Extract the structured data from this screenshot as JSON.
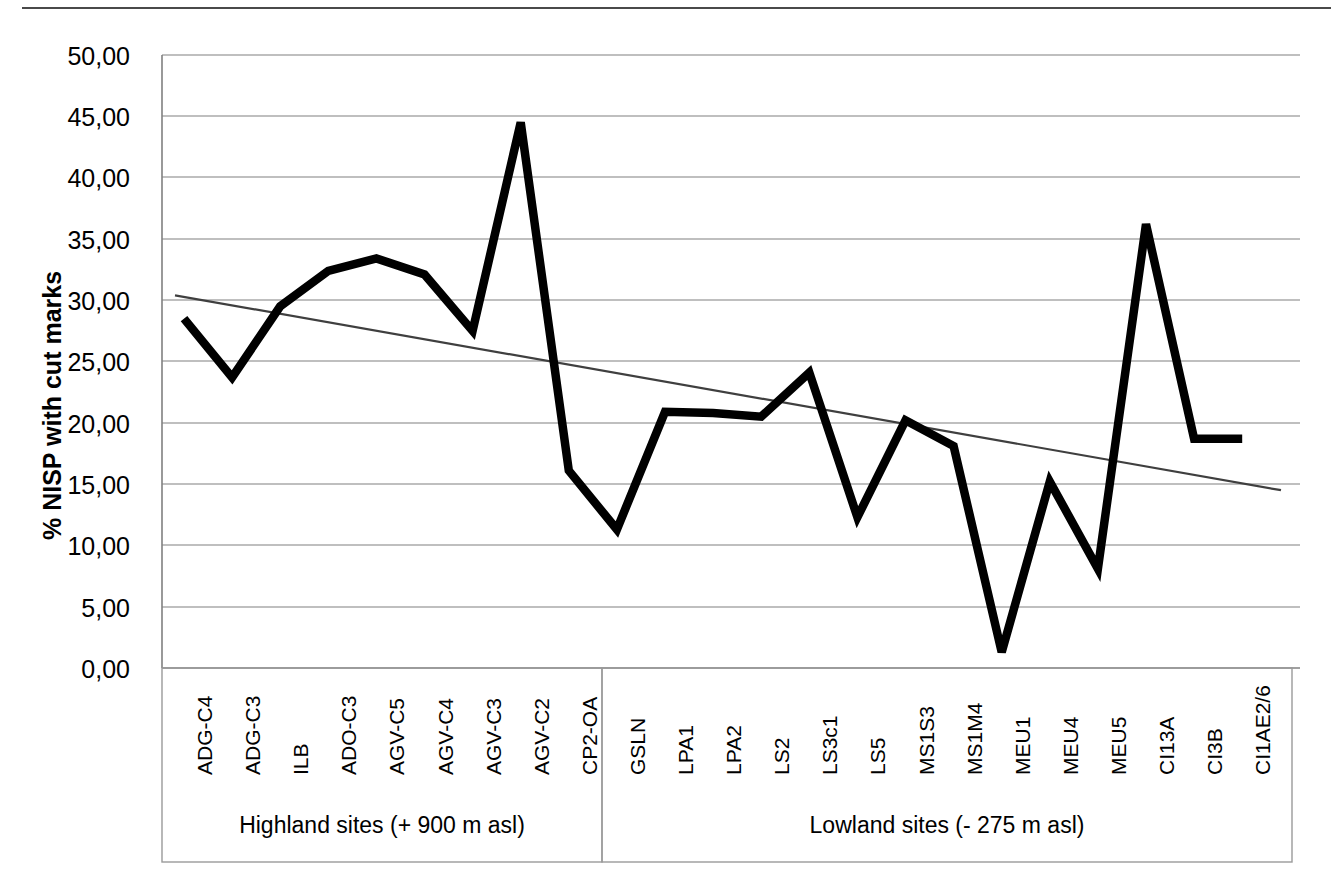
{
  "chart_data": {
    "type": "line",
    "title": "",
    "xlabel": "",
    "ylabel": "% NISP with cut marks",
    "ylim": [
      0,
      50
    ],
    "ytick_step": 5,
    "grid": true,
    "legend": "none",
    "line_color": "#000000",
    "trendline_color": "#3f3f3f",
    "categories": [
      "ADG-C4",
      "ADG-C3",
      "ILB",
      "ADO-C3",
      "AGV-C5",
      "AGV-C4",
      "AGV-C3",
      "AGV-C2",
      "CP2-OA",
      "GSLN",
      "LPA1",
      "LPA2",
      "LS2",
      "LS3c1",
      "LS5",
      "MS1S3",
      "MS1M4",
      "MEU1",
      "MEU4",
      "MEU5",
      "CI13A",
      "CI3B",
      "CI1AE2/6"
    ],
    "values": [
      28.5,
      23.7,
      29.5,
      32.4,
      33.4,
      32.1,
      27.5,
      44.5,
      16.1,
      11.3,
      20.9,
      20.8,
      20.5,
      24.1,
      12.3,
      20.2,
      18.1,
      1.3,
      15.2,
      8.1,
      36.2,
      18.7,
      18.7
    ],
    "ytick_labels": [
      "0,00",
      "5,00",
      "10,00",
      "15,00",
      "20,00",
      "25,00",
      "30,00",
      "35,00",
      "40,00",
      "45,00",
      "50,00"
    ],
    "ytick_values": [
      0,
      5,
      10,
      15,
      20,
      25,
      30,
      35,
      40,
      45,
      50
    ],
    "series": [
      {
        "name": "% NISP with cut marks",
        "values": [
          28.5,
          23.7,
          29.5,
          32.4,
          33.4,
          32.1,
          27.5,
          44.5,
          16.1,
          11.3,
          20.9,
          20.8,
          20.5,
          24.1,
          12.3,
          20.2,
          18.1,
          1.3,
          15.2,
          8.1,
          36.2,
          18.7,
          18.7
        ]
      },
      {
        "name": "linear trendline",
        "start_value": 30.4,
        "end_value": 14.5
      }
    ],
    "groups": [
      {
        "label": "Highland sites (+ 900 m asl)",
        "start_index": 0,
        "end_index": 8
      },
      {
        "label": "Lowland sites (- 275 m asl)",
        "start_index": 9,
        "end_index": 22
      }
    ]
  }
}
